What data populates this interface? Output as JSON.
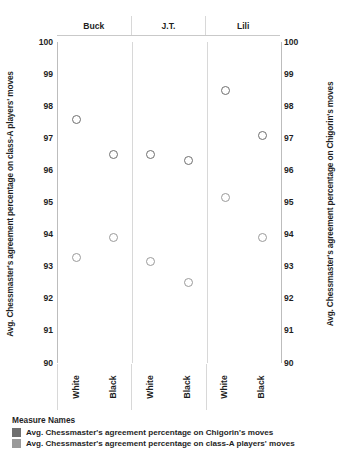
{
  "chart_data": {
    "type": "scatter",
    "title": "",
    "subtitle": "",
    "xlabel": "",
    "ylabel": "Avg. Chessmaster's agreement percentage on class-A players' moves",
    "y2label": "Avg. Chessmaster's agreement percentage on Chigorin's moves",
    "ylim": [
      90,
      100
    ],
    "y2lim": [
      90,
      100
    ],
    "y_ticks": [
      100,
      99,
      98,
      97,
      96,
      95,
      94,
      93,
      92,
      91,
      90
    ],
    "y2_ticks": [
      100,
      99,
      98,
      97,
      96,
      95,
      94,
      93,
      92,
      91,
      90
    ],
    "grid": false,
    "legend_position": "bottom-left",
    "legend_title": "Measure Names",
    "panels": [
      "Buck",
      "J.T.",
      "Lili"
    ],
    "categories": [
      "White",
      "Black",
      "White",
      "Black",
      "White",
      "Black"
    ],
    "x": [
      {
        "panel": "Buck",
        "color": "White"
      },
      {
        "panel": "Buck",
        "color": "Black"
      },
      {
        "panel": "J.T.",
        "color": "White"
      },
      {
        "panel": "J.T.",
        "color": "Black"
      },
      {
        "panel": "Lili",
        "color": "White"
      },
      {
        "panel": "Lili",
        "color": "Black"
      }
    ],
    "series": [
      {
        "name": "Avg. Chessmaster's agreement percentage on Chigorin's moves",
        "color": "#6f6f6f",
        "axis": "right",
        "marker": "open-circle",
        "values": [
          97.6,
          96.5,
          96.5,
          96.3,
          98.5,
          97.1
        ]
      },
      {
        "name": "Avg. Chessmaster's agreement percentage on class-A players' moves",
        "color": "#9a9a9a",
        "axis": "left",
        "marker": "open-circle",
        "values": [
          93.3,
          93.9,
          93.15,
          92.5,
          95.15,
          93.9
        ]
      }
    ]
  },
  "panel_headers": [
    {
      "label": "Buck"
    },
    {
      "label": "J.T."
    },
    {
      "label": "Lili"
    }
  ],
  "x_axis": {
    "ticks": [
      {
        "label": "White"
      },
      {
        "label": "Black"
      },
      {
        "label": "White"
      },
      {
        "label": "Black"
      },
      {
        "label": "White"
      },
      {
        "label": "Black"
      }
    ]
  },
  "y_axis_left": {
    "title": "Avg. Chessmaster's agreement percentage on class-A players' moves",
    "ticks": [
      "100",
      "99",
      "98",
      "97",
      "96",
      "95",
      "94",
      "93",
      "92",
      "91",
      "90"
    ]
  },
  "y_axis_right": {
    "title": "Avg. Chessmaster's agreement percentage on Chigorin's moves",
    "ticks": [
      "100",
      "99",
      "98",
      "97",
      "96",
      "95",
      "94",
      "93",
      "92",
      "91",
      "90"
    ]
  },
  "legend": {
    "title": "Measure Names",
    "items": [
      {
        "label": "Avg. Chessmaster's agreement percentage on Chigorin's moves",
        "color": "#6f6f6f"
      },
      {
        "label": "Avg. Chessmaster's agreement percentage on class-A players' moves",
        "color": "#9a9a9a"
      }
    ]
  }
}
